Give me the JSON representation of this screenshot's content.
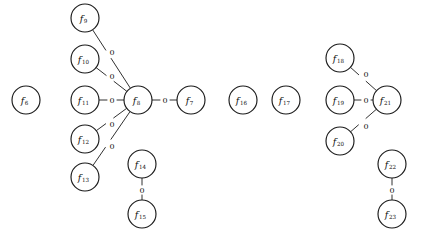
{
  "diagram": {
    "type": "node-link-graph",
    "title": "",
    "width": 421,
    "height": 232,
    "node_radius": 14,
    "edge_label_all": "0",
    "colors": {
      "background": "#ffffff",
      "node_fill": "#ffffff",
      "node_stroke": "#1a1a1a",
      "edge_stroke": "#1a1a1a",
      "text": "#111111"
    },
    "nodes": [
      {
        "id": "f6",
        "base": "f",
        "sub": "6",
        "label": "f6",
        "cx": 26,
        "cy": 100
      },
      {
        "id": "f9",
        "base": "f",
        "sub": "9",
        "label": "f9",
        "cx": 85,
        "cy": 18
      },
      {
        "id": "f10",
        "base": "f",
        "sub": "10",
        "label": "f10",
        "cx": 85,
        "cy": 59
      },
      {
        "id": "f11",
        "base": "f",
        "sub": "11",
        "label": "f11",
        "cx": 85,
        "cy": 100
      },
      {
        "id": "f12",
        "base": "f",
        "sub": "12",
        "label": "f12",
        "cx": 85,
        "cy": 139
      },
      {
        "id": "f13",
        "base": "f",
        "sub": "13",
        "label": "f13",
        "cx": 85,
        "cy": 177
      },
      {
        "id": "f8",
        "base": "f",
        "sub": "8",
        "label": "f8",
        "cx": 138,
        "cy": 100
      },
      {
        "id": "f7",
        "base": "f",
        "sub": "7",
        "label": "f7",
        "cx": 191,
        "cy": 100
      },
      {
        "id": "f14",
        "base": "f",
        "sub": "14",
        "label": "f14",
        "cx": 142,
        "cy": 164
      },
      {
        "id": "f15",
        "base": "f",
        "sub": "15",
        "label": "f15",
        "cx": 142,
        "cy": 214
      },
      {
        "id": "f16",
        "base": "f",
        "sub": "16",
        "label": "f16",
        "cx": 243,
        "cy": 100
      },
      {
        "id": "f17",
        "base": "f",
        "sub": "17",
        "label": "f17",
        "cx": 286,
        "cy": 100
      },
      {
        "id": "f18",
        "base": "f",
        "sub": "18",
        "label": "f18",
        "cx": 340,
        "cy": 58
      },
      {
        "id": "f19",
        "base": "f",
        "sub": "19",
        "label": "f19",
        "cx": 340,
        "cy": 100
      },
      {
        "id": "f20",
        "base": "f",
        "sub": "20",
        "label": "f20",
        "cx": 340,
        "cy": 141
      },
      {
        "id": "f21",
        "base": "f",
        "sub": "21",
        "label": "f21",
        "cx": 387,
        "cy": 100
      },
      {
        "id": "f22",
        "base": "f",
        "sub": "22",
        "label": "f22",
        "cx": 392,
        "cy": 164
      },
      {
        "id": "f23",
        "base": "f",
        "sub": "23",
        "label": "f23",
        "cx": 392,
        "cy": 214
      }
    ],
    "edges": [
      {
        "source": "f9",
        "target": "f8",
        "label": "0",
        "lx": 112,
        "ly": 52
      },
      {
        "source": "f10",
        "target": "f8",
        "label": "0",
        "lx": 112,
        "ly": 76
      },
      {
        "source": "f11",
        "target": "f8",
        "label": "0",
        "lx": 112,
        "ly": 100
      },
      {
        "source": "f12",
        "target": "f8",
        "label": "0",
        "lx": 112,
        "ly": 124
      },
      {
        "source": "f13",
        "target": "f8",
        "label": "0",
        "lx": 112,
        "ly": 146
      },
      {
        "source": "f8",
        "target": "f7",
        "label": "0",
        "lx": 165,
        "ly": 100
      },
      {
        "source": "f14",
        "target": "f15",
        "label": "0",
        "lx": 142,
        "ly": 190
      },
      {
        "source": "f18",
        "target": "f21",
        "label": "0",
        "lx": 366,
        "ly": 74
      },
      {
        "source": "f19",
        "target": "f21",
        "label": "0",
        "lx": 366,
        "ly": 100
      },
      {
        "source": "f20",
        "target": "f21",
        "label": "0",
        "lx": 366,
        "ly": 126
      },
      {
        "source": "f22",
        "target": "f23",
        "label": "0",
        "lx": 392,
        "ly": 190
      }
    ],
    "isolated_nodes": [
      "f6",
      "f16",
      "f17"
    ]
  }
}
